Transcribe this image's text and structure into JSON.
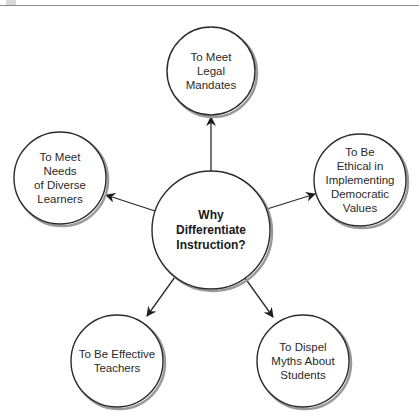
{
  "diagram": {
    "title_question": "Why\nDifferentiate\nInstruction?",
    "center": {
      "cx": 211,
      "cy": 230,
      "r": 59,
      "label": "Why\nDifferentiate\nInstruction?"
    },
    "nodes": [
      {
        "id": "legal",
        "cx": 211,
        "cy": 71,
        "r": 44,
        "label": "To Meet\nLegal\nMandates"
      },
      {
        "id": "diverse",
        "cx": 60,
        "cy": 178,
        "r": 46,
        "label": "To Meet\nNeeds\nof Diverse\nLearners"
      },
      {
        "id": "ethical",
        "cx": 360,
        "cy": 180,
        "r": 46,
        "label": "To Be\nEthical in\nImplementing\nDemocratic\nValues"
      },
      {
        "id": "effective",
        "cx": 117,
        "cy": 361,
        "r": 46,
        "label": "To Be Effective\nTeachers"
      },
      {
        "id": "myths",
        "cx": 303,
        "cy": 361,
        "r": 46,
        "label": "To Dispel\nMyths About\nStudents"
      }
    ],
    "edges": [
      {
        "to": "legal",
        "x1": 211,
        "y1": 171,
        "x2": 211,
        "y2": 117
      },
      {
        "to": "diverse",
        "x1": 155,
        "y1": 211,
        "x2": 106,
        "y2": 195
      },
      {
        "to": "ethical",
        "x1": 267,
        "y1": 209,
        "x2": 315,
        "y2": 194
      },
      {
        "to": "effective",
        "x1": 175,
        "y1": 277,
        "x2": 147,
        "y2": 316
      },
      {
        "to": "myths",
        "x1": 245,
        "y1": 278,
        "x2": 273,
        "y2": 317
      }
    ],
    "colors": {
      "stroke": "#2b2b2b",
      "shadow": "#9a9a9a",
      "fill": "#ffffff",
      "text": "#2a2a2a"
    }
  }
}
